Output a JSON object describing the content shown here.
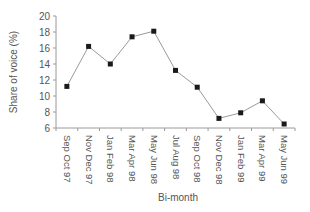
{
  "chart_data": {
    "type": "line",
    "title": "",
    "xlabel": "Bi-month",
    "ylabel": "Share of voice (%)",
    "categories": [
      "Sep Oct 97",
      "Nov Dec 97",
      "Jan Feb 98",
      "Mar Apr 98",
      "May Jun 98",
      "Jul Aug 98",
      "Sep Oct 98",
      "Nov Dec 98",
      "Jan Feb 99",
      "Mar Apr 99",
      "May Jun 99"
    ],
    "series": [
      {
        "name": "Share of voice",
        "values": [
          11.2,
          16.2,
          14.0,
          17.4,
          18.1,
          13.2,
          11.1,
          7.2,
          7.9,
          9.4,
          6.5
        ]
      }
    ],
    "ylim": [
      6,
      20
    ],
    "yticks": [
      6,
      8,
      10,
      12,
      14,
      16,
      18,
      20
    ],
    "grid": false,
    "legend": "none",
    "colors": {
      "line": "#9a9a9a",
      "marker": "#1a1a1a",
      "axis": "#9a9a9a",
      "text": "#555555"
    }
  }
}
